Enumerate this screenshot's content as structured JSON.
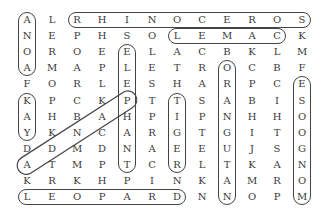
{
  "puzzle": {
    "type": "word-search",
    "rows": 12,
    "cols": 12,
    "grid": [
      [
        "A",
        "L",
        "R",
        "H",
        "I",
        "N",
        "O",
        "C",
        "E",
        "R",
        "O",
        "S"
      ],
      [
        "N",
        "E",
        "P",
        "H",
        "S",
        "O",
        "L",
        "E",
        "M",
        "A",
        "C",
        "K"
      ],
      [
        "O",
        "R",
        "O",
        "E",
        "E",
        "L",
        "A",
        "C",
        "B",
        "K",
        "L",
        "M"
      ],
      [
        "A",
        "M",
        "A",
        "P",
        "L",
        "E",
        "T",
        "R",
        "O",
        "C",
        "B",
        "F"
      ],
      [
        "F",
        "O",
        "R",
        "L",
        "E",
        "S",
        "H",
        "A",
        "R",
        "P",
        "C",
        "E"
      ],
      [
        "K",
        "P",
        "C",
        "K",
        "P",
        "T",
        "T",
        "S",
        "A",
        "B",
        "I",
        "S"
      ],
      [
        "A",
        "H",
        "B",
        "A",
        "H",
        "P",
        "I",
        "P",
        "N",
        "H",
        "H",
        "O"
      ],
      [
        "Y",
        "K",
        "N",
        "C",
        "A",
        "R",
        "G",
        "T",
        "G",
        "I",
        "T",
        "O"
      ],
      [
        "D",
        "D",
        "M",
        "D",
        "N",
        "A",
        "E",
        "E",
        "U",
        "J",
        "S",
        "G"
      ],
      [
        "A",
        "T",
        "M",
        "P",
        "T",
        "C",
        "R",
        "L",
        "T",
        "K",
        "A",
        "N"
      ],
      [
        "K",
        "R",
        "K",
        "H",
        "P",
        "I",
        "N",
        "K",
        "A",
        "M",
        "R",
        "O"
      ],
      [
        "L",
        "E",
        "O",
        "P",
        "A",
        "R",
        "D",
        "N",
        "N",
        "O",
        "P",
        "M"
      ]
    ],
    "found_words": [
      {
        "word": "ANOA",
        "direction": "down",
        "start": [
          0,
          0
        ],
        "end": [
          3,
          0
        ]
      },
      {
        "word": "RHINOCEROS",
        "direction": "right",
        "start": [
          0,
          2
        ],
        "end": [
          0,
          11
        ]
      },
      {
        "word": "CAMEL",
        "direction": "left",
        "start": [
          1,
          10
        ],
        "end": [
          1,
          6
        ]
      },
      {
        "word": "ELEPHANT",
        "direction": "down",
        "start": [
          2,
          4
        ],
        "end": [
          9,
          4
        ]
      },
      {
        "word": "ORANGUTAN",
        "direction": "down",
        "start": [
          3,
          8
        ],
        "end": [
          11,
          8
        ]
      },
      {
        "word": "MONGOOSE",
        "direction": "up",
        "start": [
          11,
          11
        ],
        "end": [
          4,
          11
        ]
      },
      {
        "word": "YAK",
        "direction": "up",
        "start": [
          7,
          0
        ],
        "end": [
          5,
          0
        ]
      },
      {
        "word": "TIGER",
        "direction": "down",
        "start": [
          5,
          6
        ],
        "end": [
          9,
          6
        ]
      },
      {
        "word": "PANDA",
        "direction": "diagonal-down-left",
        "start": [
          5,
          4
        ],
        "end": [
          9,
          0
        ]
      },
      {
        "word": "LEOPARD",
        "direction": "right",
        "start": [
          11,
          0
        ],
        "end": [
          11,
          6
        ]
      }
    ]
  }
}
